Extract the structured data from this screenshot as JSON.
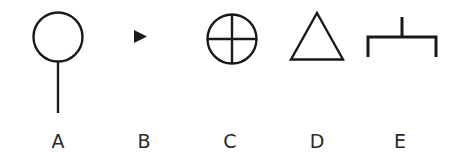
{
  "diagram": {
    "stroke_color": "#1a1a1a",
    "symbols": [
      {
        "id": "A",
        "label": "A",
        "shape": "circle-on-stem",
        "label_x": 58
      },
      {
        "id": "B",
        "label": "B",
        "shape": "small-filled-right-triangle",
        "label_x": 144
      },
      {
        "id": "C",
        "label": "C",
        "shape": "circle-with-cross",
        "label_x": 230
      },
      {
        "id": "D",
        "label": "D",
        "shape": "outline-triangle",
        "label_x": 317
      },
      {
        "id": "E",
        "label": "E",
        "shape": "bracket-with-top-tick",
        "label_x": 400
      }
    ]
  }
}
